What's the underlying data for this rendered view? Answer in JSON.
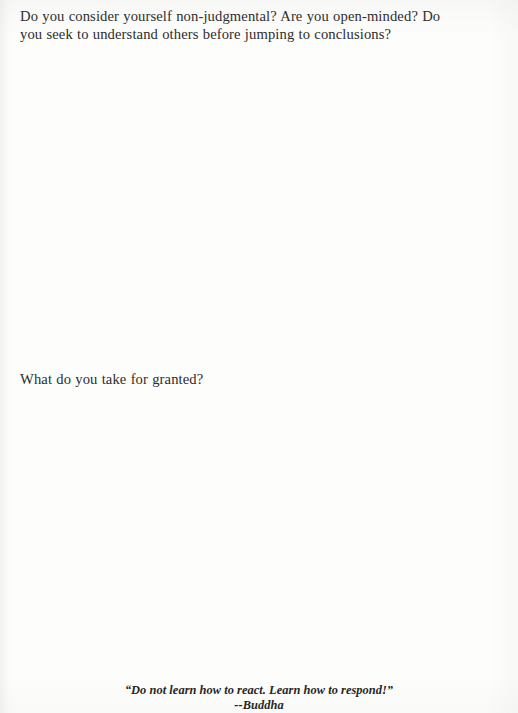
{
  "page": {
    "background_color": "#fdfdfc",
    "text_color": "#2b2b2b",
    "document_type": "journal-reflection-page"
  },
  "prompts": [
    {
      "id": "prompt-non-judgmental",
      "text": "Do you consider yourself non-judgmental? Are you open-minded? Do you seek to understand others before jumping to conclusions?"
    },
    {
      "id": "prompt-take-for-granted",
      "text": "What do you take for granted?"
    }
  ],
  "answer_spaces": [
    {
      "id": "answer-space-1",
      "text": ""
    },
    {
      "id": "answer-space-2",
      "text": ""
    }
  ],
  "footer": {
    "quote": "“Do not learn how to react. Learn how to respond!”",
    "attribution": "--Buddha"
  }
}
